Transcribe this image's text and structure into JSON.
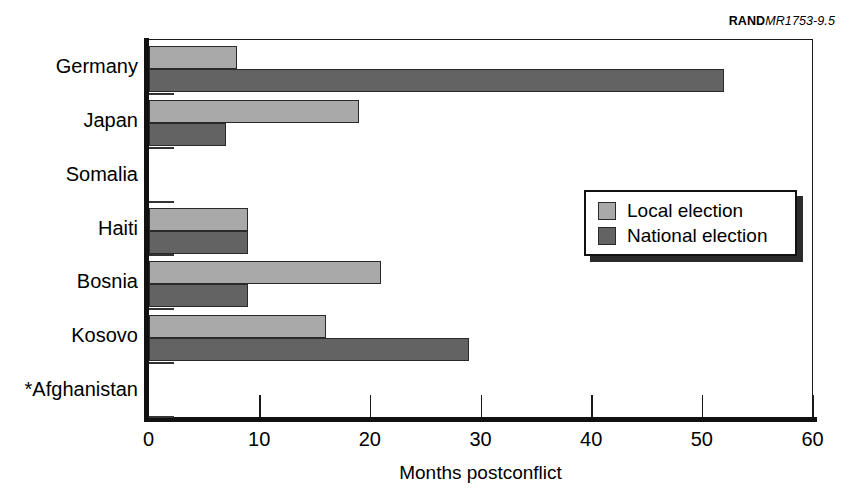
{
  "figure_id": {
    "brand": "RAND",
    "number": "MR1753-9.5"
  },
  "chart_data": {
    "type": "bar",
    "orientation": "horizontal",
    "title": "",
    "xlabel": "Months postconflict",
    "ylabel": "",
    "xlim": [
      0,
      60
    ],
    "xticks": [
      0,
      10,
      20,
      30,
      40,
      50,
      60
    ],
    "xtick_labels": [
      "0",
      "10",
      "20",
      "30",
      "40",
      "50",
      "60"
    ],
    "grid": false,
    "categories": [
      "Germany",
      "Japan",
      "Somalia",
      "Haiti",
      "Bosnia",
      "Kosovo",
      "*Afghanistan"
    ],
    "series": [
      {
        "name": "Local election",
        "color": "#a9a9a9",
        "values": [
          8,
          19,
          null,
          9,
          21,
          16,
          null
        ]
      },
      {
        "name": "National election",
        "color": "#636363",
        "values": [
          52,
          7,
          null,
          9,
          9,
          29,
          null
        ]
      }
    ],
    "legend": {
      "position": "center-right",
      "entries": [
        "Local election",
        "National election"
      ]
    }
  }
}
